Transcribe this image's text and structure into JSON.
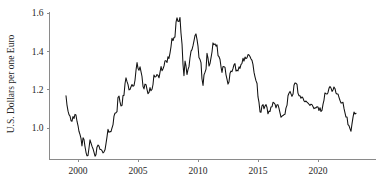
{
  "chart_data": {
    "type": "line",
    "title": "",
    "subtitle": "",
    "xlabel": "",
    "ylabel": "U.S. Dollars per one Euro",
    "xlim": [
      1998.9,
      2023.3
    ],
    "ylim": [
      0.82,
      1.62
    ],
    "grid": false,
    "legend": null,
    "legend_position": "none",
    "xticks": [
      2000,
      2005,
      2010,
      2015,
      2020
    ],
    "xtick_labels": [
      "2000",
      "2005",
      "2010",
      "2015",
      "2020"
    ],
    "yticks": [
      1.0,
      1.2,
      1.4,
      1.6
    ],
    "ytick_labels": [
      "1.0",
      "1.2",
      "1.4",
      "1.6"
    ],
    "line_color": "#111111",
    "axis_color": "#8a8a8a",
    "series": [
      {
        "name": "EUR/USD exchange rate",
        "x": [
          1999.0,
          1999.08,
          1999.17,
          1999.25,
          1999.33,
          1999.42,
          1999.5,
          1999.58,
          1999.67,
          1999.75,
          1999.83,
          1999.92,
          2000.0,
          2000.08,
          2000.17,
          2000.25,
          2000.33,
          2000.42,
          2000.5,
          2000.58,
          2000.67,
          2000.75,
          2000.83,
          2000.92,
          2001.0,
          2001.08,
          2001.17,
          2001.25,
          2001.33,
          2001.42,
          2001.5,
          2001.58,
          2001.67,
          2001.75,
          2001.83,
          2001.92,
          2002.0,
          2002.08,
          2002.17,
          2002.25,
          2002.33,
          2002.42,
          2002.5,
          2002.58,
          2002.67,
          2002.75,
          2002.83,
          2002.92,
          2003.0,
          2003.08,
          2003.17,
          2003.25,
          2003.33,
          2003.42,
          2003.5,
          2003.58,
          2003.67,
          2003.75,
          2003.83,
          2003.92,
          2004.0,
          2004.08,
          2004.17,
          2004.25,
          2004.33,
          2004.42,
          2004.5,
          2004.58,
          2004.67,
          2004.75,
          2004.83,
          2004.92,
          2005.0,
          2005.08,
          2005.17,
          2005.25,
          2005.33,
          2005.42,
          2005.5,
          2005.58,
          2005.67,
          2005.75,
          2005.83,
          2005.92,
          2006.0,
          2006.08,
          2006.17,
          2006.25,
          2006.33,
          2006.42,
          2006.5,
          2006.58,
          2006.67,
          2006.75,
          2006.83,
          2006.92,
          2007.0,
          2007.08,
          2007.17,
          2007.25,
          2007.33,
          2007.42,
          2007.5,
          2007.58,
          2007.67,
          2007.75,
          2007.83,
          2007.92,
          2008.0,
          2008.08,
          2008.17,
          2008.25,
          2008.33,
          2008.42,
          2008.5,
          2008.58,
          2008.67,
          2008.75,
          2008.83,
          2008.92,
          2009.0,
          2009.08,
          2009.17,
          2009.25,
          2009.33,
          2009.42,
          2009.5,
          2009.58,
          2009.67,
          2009.75,
          2009.83,
          2009.92,
          2010.0,
          2010.08,
          2010.17,
          2010.25,
          2010.33,
          2010.42,
          2010.5,
          2010.58,
          2010.67,
          2010.75,
          2010.83,
          2010.92,
          2011.0,
          2011.08,
          2011.17,
          2011.25,
          2011.33,
          2011.42,
          2011.5,
          2011.58,
          2011.67,
          2011.75,
          2011.83,
          2011.92,
          2012.0,
          2012.08,
          2012.17,
          2012.25,
          2012.33,
          2012.42,
          2012.5,
          2012.58,
          2012.67,
          2012.75,
          2012.83,
          2012.92,
          2013.0,
          2013.08,
          2013.17,
          2013.25,
          2013.33,
          2013.42,
          2013.5,
          2013.58,
          2013.67,
          2013.75,
          2013.83,
          2013.92,
          2014.0,
          2014.08,
          2014.17,
          2014.25,
          2014.33,
          2014.42,
          2014.5,
          2014.58,
          2014.67,
          2014.75,
          2014.83,
          2014.92,
          2015.0,
          2015.08,
          2015.17,
          2015.25,
          2015.33,
          2015.42,
          2015.5,
          2015.58,
          2015.67,
          2015.75,
          2015.83,
          2015.92,
          2016.0,
          2016.08,
          2016.17,
          2016.25,
          2016.33,
          2016.42,
          2016.5,
          2016.58,
          2016.67,
          2016.75,
          2016.83,
          2016.92,
          2017.0,
          2017.08,
          2017.17,
          2017.25,
          2017.33,
          2017.42,
          2017.5,
          2017.58,
          2017.67,
          2017.75,
          2017.83,
          2017.92,
          2018.0,
          2018.08,
          2018.17,
          2018.25,
          2018.33,
          2018.42,
          2018.5,
          2018.58,
          2018.67,
          2018.75,
          2018.83,
          2018.92,
          2019.0,
          2019.08,
          2019.17,
          2019.25,
          2019.33,
          2019.42,
          2019.5,
          2019.58,
          2019.67,
          2019.75,
          2019.83,
          2019.92,
          2020.0,
          2020.08,
          2020.17,
          2020.25,
          2020.33,
          2020.42,
          2020.5,
          2020.58,
          2020.67,
          2020.75,
          2020.83,
          2020.92,
          2021.0,
          2021.08,
          2021.17,
          2021.25,
          2021.33,
          2021.42,
          2021.5,
          2021.58,
          2021.67,
          2021.75,
          2021.83,
          2021.92,
          2022.0,
          2022.08,
          2022.17,
          2022.25,
          2022.33,
          2022.42,
          2022.5,
          2022.58,
          2022.67,
          2022.75,
          2022.83,
          2022.92,
          2023.0,
          2023.08,
          2023.17
        ],
        "y": [
          1.168,
          1.121,
          1.088,
          1.07,
          1.063,
          1.038,
          1.035,
          1.06,
          1.05,
          1.071,
          1.068,
          1.034,
          1.013,
          0.983,
          0.965,
          0.946,
          0.906,
          0.949,
          0.94,
          0.904,
          0.872,
          0.855,
          0.855,
          0.897,
          0.938,
          0.922,
          0.904,
          0.892,
          0.874,
          0.853,
          0.861,
          0.9,
          0.911,
          0.905,
          0.888,
          0.888,
          0.882,
          0.87,
          0.876,
          0.886,
          0.917,
          0.955,
          0.993,
          0.978,
          0.981,
          0.981,
          0.999,
          1.018,
          1.062,
          1.077,
          1.08,
          1.085,
          1.159,
          1.166,
          1.136,
          1.115,
          1.118,
          1.169,
          1.17,
          1.232,
          1.262,
          1.243,
          1.226,
          1.199,
          1.201,
          1.215,
          1.227,
          1.218,
          1.222,
          1.249,
          1.299,
          1.341,
          1.312,
          1.301,
          1.319,
          1.294,
          1.27,
          1.216,
          1.204,
          1.229,
          1.226,
          1.202,
          1.179,
          1.186,
          1.211,
          1.194,
          1.202,
          1.227,
          1.277,
          1.266,
          1.268,
          1.279,
          1.274,
          1.262,
          1.289,
          1.321,
          1.299,
          1.308,
          1.324,
          1.351,
          1.351,
          1.342,
          1.372,
          1.363,
          1.392,
          1.424,
          1.468,
          1.456,
          1.472,
          1.475,
          1.552,
          1.575,
          1.557,
          1.556,
          1.577,
          1.497,
          1.437,
          1.332,
          1.273,
          1.349,
          1.324,
          1.279,
          1.306,
          1.32,
          1.365,
          1.401,
          1.409,
          1.428,
          1.456,
          1.482,
          1.491,
          1.461,
          1.427,
          1.368,
          1.357,
          1.341,
          1.257,
          1.222,
          1.277,
          1.29,
          1.307,
          1.39,
          1.366,
          1.323,
          1.336,
          1.365,
          1.398,
          1.444,
          1.435,
          1.439,
          1.427,
          1.434,
          1.378,
          1.372,
          1.359,
          1.318,
          1.29,
          1.321,
          1.32,
          1.316,
          1.279,
          1.254,
          1.229,
          1.24,
          1.286,
          1.297,
          1.294,
          1.311,
          1.33,
          1.336,
          1.297,
          1.302,
          1.298,
          1.319,
          1.311,
          1.331,
          1.338,
          1.364,
          1.349,
          1.37,
          1.362,
          1.366,
          1.383,
          1.381,
          1.373,
          1.36,
          1.353,
          1.332,
          1.29,
          1.267,
          1.247,
          1.232,
          1.162,
          1.135,
          1.084,
          1.082,
          1.116,
          1.122,
          1.1,
          1.114,
          1.122,
          1.107,
          1.074,
          1.088,
          1.086,
          1.11,
          1.111,
          1.134,
          1.131,
          1.124,
          1.105,
          1.121,
          1.121,
          1.102,
          1.08,
          1.056,
          1.062,
          1.065,
          1.07,
          1.072,
          1.104,
          1.119,
          1.168,
          1.181,
          1.191,
          1.178,
          1.165,
          1.177,
          1.223,
          1.235,
          1.233,
          1.228,
          1.182,
          1.168,
          1.168,
          1.155,
          1.162,
          1.156,
          1.142,
          1.137,
          1.141,
          1.135,
          1.13,
          1.124,
          1.118,
          1.124,
          1.122,
          1.112,
          1.101,
          1.105,
          1.105,
          1.111,
          1.11,
          1.091,
          1.106,
          1.086,
          1.092,
          1.125,
          1.146,
          1.183,
          1.179,
          1.177,
          1.184,
          1.208,
          1.217,
          1.209,
          1.191,
          1.198,
          1.214,
          1.205,
          1.182,
          1.177,
          1.177,
          1.16,
          1.145,
          1.13,
          1.131,
          1.134,
          1.101,
          1.079,
          1.057,
          1.057,
          1.017,
          1.012,
          0.996,
          0.983,
          1.02,
          1.057,
          1.083,
          1.073,
          1.077
        ]
      }
    ]
  }
}
